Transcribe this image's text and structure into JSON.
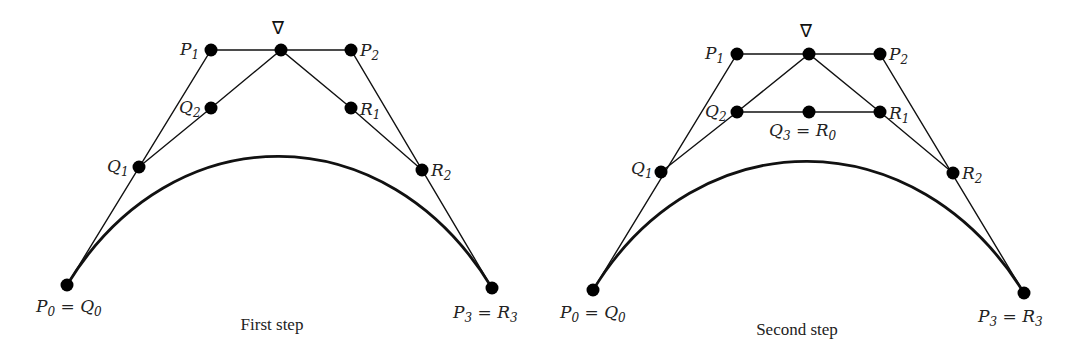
{
  "panels": [
    {
      "caption": "First step",
      "nabla": "∇",
      "labels": {
        "p0": {
          "main": "P",
          "sub": "0",
          "eq": " = ",
          "main2": "Q",
          "sub2": "0"
        },
        "p1": {
          "main": "P",
          "sub": "1"
        },
        "p2": {
          "main": "P",
          "sub": "2"
        },
        "p3": {
          "main": "P",
          "sub": "3",
          "eq": " = ",
          "main2": "R",
          "sub2": "3"
        },
        "q1": {
          "main": "Q",
          "sub": "1"
        },
        "q2": {
          "main": "Q",
          "sub": "2"
        },
        "r1": {
          "main": "R",
          "sub": "1"
        },
        "r2": {
          "main": "R",
          "sub": "2"
        }
      }
    },
    {
      "caption": "Second step",
      "nabla": "∇",
      "labels": {
        "p0": {
          "main": "P",
          "sub": "0",
          "eq": " = ",
          "main2": "Q",
          "sub2": "0"
        },
        "p1": {
          "main": "P",
          "sub": "1"
        },
        "p2": {
          "main": "P",
          "sub": "2"
        },
        "p3": {
          "main": "P",
          "sub": "3",
          "eq": " = ",
          "main2": "R",
          "sub2": "3"
        },
        "q1": {
          "main": "Q",
          "sub": "1"
        },
        "q2": {
          "main": "Q",
          "sub": "2"
        },
        "q3r0": {
          "main": "Q",
          "sub": "3",
          "eq": " = ",
          "main2": "R",
          "sub2": "0"
        },
        "r1": {
          "main": "R",
          "sub": "1"
        },
        "r2": {
          "main": "R",
          "sub": "2"
        }
      }
    }
  ],
  "colors": {
    "ink": "#111111",
    "background": "#ffffff"
  }
}
